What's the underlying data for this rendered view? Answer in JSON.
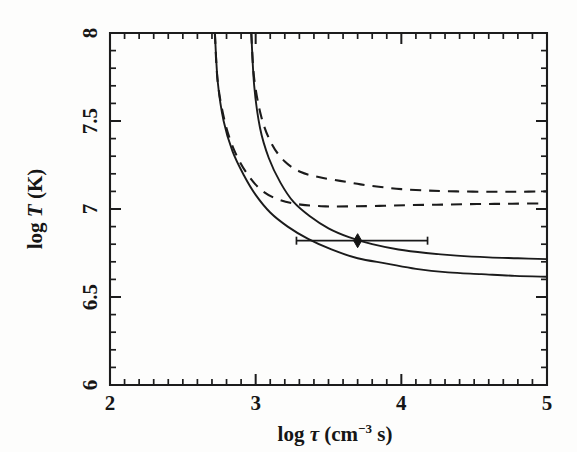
{
  "figure": {
    "background_color": "#fdfdfc",
    "ink_color": "#1b1b1b"
  },
  "axes": {
    "x_title_prefix": "log",
    "x_title_symbol": "τ",
    "x_title_unit_open": "(cm",
    "x_title_exponent": "−3",
    "x_title_unit_close": "s)",
    "x_title_full": "log τ (cm⁻³ s)",
    "y_title_full": "log T (K)",
    "y_title_prefix": "log",
    "y_title_symbol": "T",
    "y_title_unit": "(K)",
    "x_ticklabels": [
      "2",
      "3",
      "4",
      "5"
    ],
    "y_ticklabels": [
      "8",
      "7.5",
      "7",
      "6.5",
      "6"
    ]
  },
  "chart_data": {
    "type": "line",
    "title": "",
    "xlabel": "log τ (cm⁻³ s)",
    "ylabel": "log T (K)",
    "xlim": [
      2,
      5
    ],
    "ylim": [
      6,
      8
    ],
    "grid": false,
    "legend": "none",
    "x_major_ticks": [
      2,
      3,
      4,
      5
    ],
    "x_minor_tick_step": 0.1,
    "y_major_ticks": [
      6,
      6.5,
      7,
      7.5,
      8
    ],
    "y_minor_tick_step": 0.1,
    "tick_direction": "in",
    "series": [
      {
        "name": "solid-left",
        "style": "solid",
        "x": [
          2.72,
          2.74,
          2.78,
          2.84,
          2.92,
          3.0,
          3.1,
          3.22,
          3.36,
          3.52,
          3.7,
          3.9,
          4.1,
          4.32,
          4.55,
          4.78,
          5.0
        ],
        "values": [
          8.0,
          7.72,
          7.5,
          7.33,
          7.19,
          7.08,
          6.98,
          6.9,
          6.83,
          6.77,
          6.72,
          6.69,
          6.66,
          6.64,
          6.63,
          6.62,
          6.615
        ]
      },
      {
        "name": "solid-right",
        "style": "solid",
        "x": [
          2.97,
          2.99,
          3.03,
          3.09,
          3.17,
          3.26,
          3.37,
          3.5,
          3.64,
          3.8,
          3.98,
          4.17,
          4.38,
          4.6,
          4.8,
          5.0
        ],
        "values": [
          8.0,
          7.7,
          7.46,
          7.29,
          7.15,
          7.04,
          6.96,
          6.89,
          6.84,
          6.8,
          6.77,
          6.75,
          6.735,
          6.725,
          6.72,
          6.715
        ]
      },
      {
        "name": "dashed-upper",
        "style": "dashed",
        "x": [
          2.97,
          2.99,
          3.04,
          3.11,
          3.2,
          3.31,
          3.44,
          3.58,
          3.72,
          3.86,
          4.0,
          4.18,
          4.38,
          4.6,
          4.8,
          5.0
        ],
        "values": [
          8.0,
          7.74,
          7.52,
          7.37,
          7.27,
          7.21,
          7.18,
          7.16,
          7.14,
          7.125,
          7.113,
          7.105,
          7.1,
          7.098,
          7.098,
          7.1
        ]
      },
      {
        "name": "dashed-lower",
        "style": "dashed",
        "x": [
          2.72,
          2.74,
          2.79,
          2.86,
          2.95,
          3.05,
          3.17,
          3.31,
          3.48,
          3.66,
          3.85,
          4.05,
          4.28,
          4.52,
          4.76,
          5.0
        ],
        "values": [
          8.0,
          7.72,
          7.49,
          7.32,
          7.19,
          7.1,
          7.05,
          7.025,
          7.015,
          7.015,
          7.018,
          7.022,
          7.025,
          7.028,
          7.03,
          7.032
        ]
      }
    ],
    "annotations": [
      {
        "type": "datapoint-with-xerror",
        "x": 3.7,
        "y": 6.82,
        "x_err_low": 3.28,
        "x_err_high": 4.18,
        "marker": "filled-diamond"
      }
    ]
  }
}
